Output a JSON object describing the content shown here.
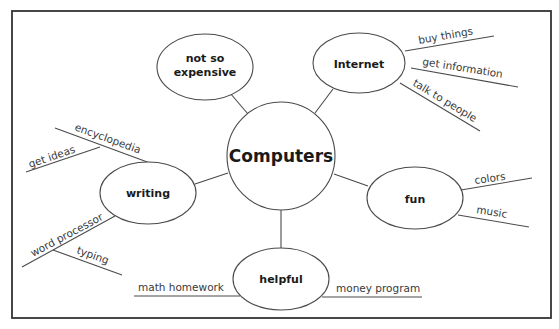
{
  "diagram": {
    "type": "concept-web",
    "center": {
      "label": "Computers"
    },
    "nodes": [
      {
        "id": "not-so-expensive",
        "lines": [
          "not so",
          "expensive"
        ],
        "branches": []
      },
      {
        "id": "internet",
        "lines": [
          "Internet"
        ],
        "branches": [
          "buy things",
          "get information",
          "talk to people"
        ]
      },
      {
        "id": "writing",
        "lines": [
          "writing"
        ],
        "branches": [
          "encyclopedia",
          "get ideas",
          "word processor",
          "typing"
        ]
      },
      {
        "id": "fun",
        "lines": [
          "fun"
        ],
        "branches": [
          "colors",
          "music"
        ]
      },
      {
        "id": "helpful",
        "lines": [
          "helpful"
        ],
        "branches": [
          "math homework",
          "money program"
        ]
      }
    ]
  },
  "colors": {
    "line": "#4a4a4a",
    "frame": "#333333",
    "text": "#1a1a1a",
    "background": "#ffffff"
  }
}
